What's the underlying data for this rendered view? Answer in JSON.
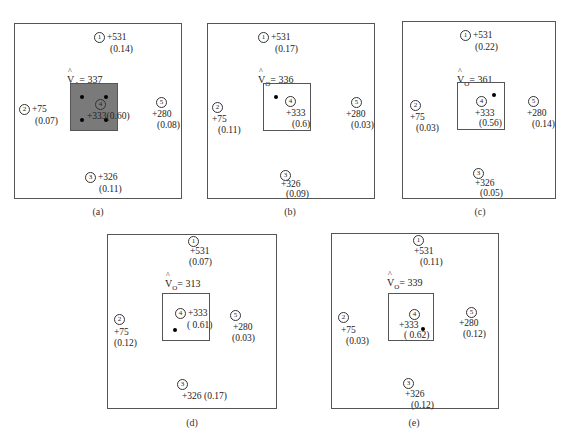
{
  "figure": {
    "panels": [
      {
        "id": "a",
        "caption": "(a)",
        "estimate": {
          "symbol": "V",
          "subscript": "A",
          "value": "= 337"
        },
        "center_shaded": true,
        "samples": [
          {
            "n": "1",
            "value": "+531",
            "weight": "(0.14)"
          },
          {
            "n": "2",
            "value": "+75",
            "weight": "(0.07)"
          },
          {
            "n": "3",
            "value": "+326",
            "weight": "(0.11)"
          },
          {
            "n": "4",
            "value": "+333",
            "weight": "(0.60)"
          },
          {
            "n": "5",
            "value": "+280",
            "weight": "(0.08)"
          }
        ]
      },
      {
        "id": "b",
        "caption": "(b)",
        "estimate": {
          "symbol": "V",
          "subscript": "O",
          "value": "= 336"
        },
        "center_shaded": false,
        "samples": [
          {
            "n": "1",
            "value": "+531",
            "weight": "(0.17)"
          },
          {
            "n": "2",
            "value": "+75",
            "weight": "(0.11)"
          },
          {
            "n": "3",
            "value": "+326",
            "weight": "(0.09)"
          },
          {
            "n": "4",
            "value": "+333",
            "weight": "(0.6)"
          },
          {
            "n": "5",
            "value": "+280",
            "weight": "(0.03)"
          }
        ]
      },
      {
        "id": "c",
        "caption": "(c)",
        "estimate": {
          "symbol": "V",
          "subscript": "O",
          "value": "= 361"
        },
        "center_shaded": false,
        "samples": [
          {
            "n": "1",
            "value": "+531",
            "weight": "(0.22)"
          },
          {
            "n": "2",
            "value": "+75",
            "weight": "(0.03)"
          },
          {
            "n": "3",
            "value": "+326",
            "weight": "(0.05)"
          },
          {
            "n": "4",
            "value": "+333",
            "weight": "(0.56)"
          },
          {
            "n": "5",
            "value": "+280",
            "weight": "(0.14)"
          }
        ]
      },
      {
        "id": "d",
        "caption": "(d)",
        "estimate": {
          "symbol": "V",
          "subscript": "O",
          "value": "= 313"
        },
        "center_shaded": false,
        "samples": [
          {
            "n": "1",
            "value": "+531",
            "weight": "(0.07)"
          },
          {
            "n": "2",
            "value": "+75",
            "weight": "(0.12)"
          },
          {
            "n": "3",
            "value": "+326",
            "weight": "(0.17)"
          },
          {
            "n": "4",
            "value": "+333",
            "weight": "( 0.61)"
          },
          {
            "n": "5",
            "value": "+280",
            "weight": "(0.03)"
          }
        ]
      },
      {
        "id": "e",
        "caption": "(e)",
        "estimate": {
          "symbol": "V",
          "subscript": "O",
          "value": "= 339"
        },
        "center_shaded": false,
        "samples": [
          {
            "n": "1",
            "value": "+531",
            "weight": "(0.11)"
          },
          {
            "n": "2",
            "value": "+75",
            "weight": "(0.03)"
          },
          {
            "n": "3",
            "value": "+326",
            "weight": "(0.12)"
          },
          {
            "n": "4",
            "value": "+333",
            "weight": "( 0.62)"
          },
          {
            "n": "5",
            "value": "+280",
            "weight": "(0.12)"
          }
        ]
      }
    ]
  }
}
